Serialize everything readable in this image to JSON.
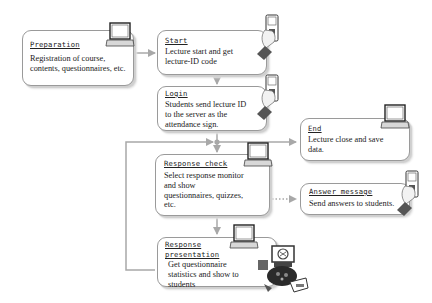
{
  "diagram": {
    "type": "flowchart",
    "nodes": [
      {
        "id": "preparation",
        "title": "Preparation",
        "description": "Registration of course, contents, questionnaires, etc.",
        "icon": "laptop-icon"
      },
      {
        "id": "start",
        "title": "Start",
        "description": "Lecture start and get lecture-ID code",
        "icon": "mobile-phone-hand-icon"
      },
      {
        "id": "login",
        "title": "Login",
        "description": "Students send lecture ID to the server as the attendance sign.",
        "icon": "mobile-phone-hand-icon"
      },
      {
        "id": "end",
        "title": "End",
        "description": "Lecture close and save data.",
        "icon": "laptop-icon"
      },
      {
        "id": "response_check",
        "title": "Response check",
        "description": "Select response monitor and show questionnaires, quizzes, etc.",
        "icon": "laptop-icon"
      },
      {
        "id": "answer_message",
        "title": "Answer message",
        "description": "Send answers to students.",
        "icon": "mobile-phone-hand-icon"
      },
      {
        "id": "response_presentation",
        "title": "Response\npresentation",
        "description": "Get questionnaire statistics and show to students",
        "icon": "laptop-icon",
        "extra_icon": "projector-presentation-icon"
      }
    ],
    "edges": [
      {
        "from": "preparation",
        "to": "start",
        "style": "solid"
      },
      {
        "from": "start",
        "to": "login",
        "style": "solid"
      },
      {
        "from": "login",
        "to": "response_check",
        "style": "solid"
      },
      {
        "from": "login",
        "to": "end",
        "style": "solid"
      },
      {
        "from": "response_check",
        "to": "response_presentation",
        "style": "solid"
      },
      {
        "from": "response_check",
        "to": "answer_message",
        "style": "dotted"
      },
      {
        "from": "response_presentation",
        "to": "response_check",
        "style": "solid",
        "label": "loop back"
      }
    ],
    "colors": {
      "line": "#9a9a9a",
      "box_border": "#9a9a9a",
      "text": "#222222"
    }
  }
}
